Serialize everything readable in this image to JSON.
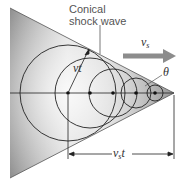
{
  "diagram": {
    "title_label_line1": "Conical",
    "title_label_line2": "shock wave",
    "velocity_source_label": "v",
    "velocity_source_sub": "s",
    "wave_radius_label": "vt",
    "angle_label": "θ",
    "distance_label_main": "v",
    "distance_label_sub": "s",
    "distance_label_tail": "t",
    "colors": {
      "cone_dark": "#8a8a8a",
      "cone_light": "#f2f2f2",
      "lines": "#222222",
      "arrow": "#8c8c8c"
    },
    "wavefronts": [
      {
        "cx": 68,
        "r": 48
      },
      {
        "cx": 90,
        "r": 35
      },
      {
        "cx": 113,
        "r": 24
      },
      {
        "cx": 136,
        "r": 15
      },
      {
        "cx": 155,
        "r": 8
      }
    ],
    "apex": {
      "x": 174,
      "y": 93
    }
  }
}
